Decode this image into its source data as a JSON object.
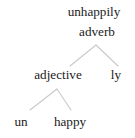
{
  "figure": {
    "type": "morphological-tree",
    "word": "unhappily",
    "background_color": "#ffffff",
    "text_color": "#1b1b1b",
    "branch_color": "#c9c9c9"
  },
  "nodes": {
    "root": "unhappily",
    "root_category": "adverb",
    "left_child_category": "adjective",
    "right_child_morpheme": "ly",
    "terminal_left": "un",
    "terminal_right": "happy"
  },
  "branches": [
    {
      "name": "adverb-split",
      "apex": [
        96,
        45
      ],
      "left_end": [
        70,
        66
      ],
      "right_end": [
        118,
        66
      ]
    },
    {
      "name": "adjective-split",
      "apex": [
        57,
        89
      ],
      "left_end": [
        30,
        110
      ],
      "right_end": [
        71,
        110
      ]
    }
  ]
}
